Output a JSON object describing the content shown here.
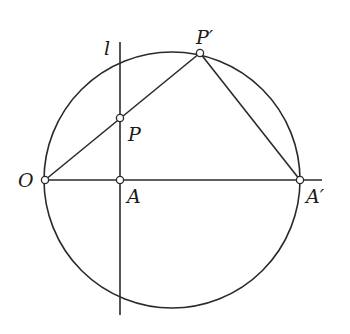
{
  "diagram": {
    "type": "geometric-construction",
    "stroke_color": "#2a2a2a",
    "background": "#ffffff",
    "circle": {
      "cx": 172,
      "cy": 180,
      "r": 128
    },
    "points": {
      "O": {
        "label": "O",
        "x": 45,
        "y": 180
      },
      "A": {
        "label": "A",
        "x": 120,
        "y": 180
      },
      "A_prime": {
        "label": "A′",
        "x": 300,
        "y": 180
      },
      "P": {
        "label": "P",
        "x": 120,
        "y": 118
      },
      "P_prime": {
        "label": "P′",
        "x": 200,
        "y": 53
      }
    },
    "line_l": {
      "label": "l",
      "x": 120,
      "y1": 42,
      "y2": 315
    },
    "segments": [
      {
        "name": "O-P-prime",
        "from": "O",
        "to": "P′"
      },
      {
        "name": "P-prime-A-prime",
        "from": "P′",
        "to": "A′"
      },
      {
        "name": "O-A-axis",
        "from": "O",
        "to": "beyond A′"
      }
    ]
  }
}
